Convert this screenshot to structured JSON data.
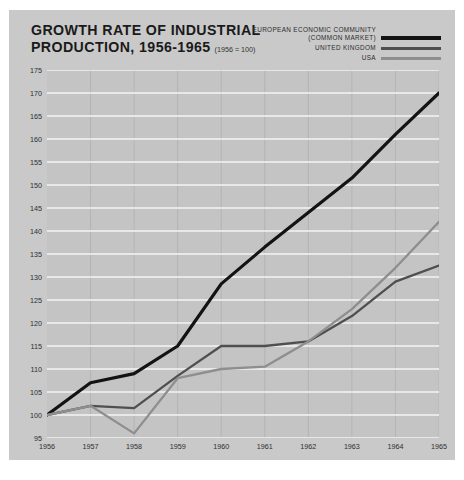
{
  "title": {
    "line1": "GROWTH RATE OF INDUSTRIAL",
    "line2": "PRODUCTION, 1956-1965",
    "base_note": "(1956 = 100)"
  },
  "legend": [
    {
      "name": "legend-eec",
      "label": "EUROPEAN ECONOMIC COMMUNITY",
      "sublabel": "(COMMON MARKET)",
      "color": "#131313"
    },
    {
      "name": "legend-uk",
      "label": "UNITED KINGDOM",
      "sublabel": "",
      "color": "#4f4f4f"
    },
    {
      "name": "legend-usa",
      "label": "USA",
      "sublabel": "",
      "color": "#8e8e8e"
    }
  ],
  "chart_data": {
    "type": "line",
    "xlabel": "",
    "ylabel": "",
    "x": [
      1956,
      1957,
      1958,
      1959,
      1960,
      1961,
      1962,
      1963,
      1964,
      1965
    ],
    "xticklabels": [
      "1956",
      "1957",
      "1958",
      "1959",
      "1960",
      "1961",
      "1962",
      "1963",
      "1964",
      "1965"
    ],
    "yticks": [
      95,
      100,
      105,
      110,
      115,
      120,
      125,
      130,
      135,
      140,
      145,
      150,
      155,
      160,
      165,
      170,
      175
    ],
    "yticklabels": [
      "95",
      "100",
      "105",
      "110",
      "115",
      "120",
      "125",
      "130",
      "135",
      "140",
      "145",
      "150",
      "155",
      "160",
      "165",
      "170",
      "175"
    ],
    "ylim": [
      95,
      175
    ],
    "xlim": [
      1956,
      1965
    ],
    "grid": "horizontal-white-and-faint-vertical",
    "legend_position": "top-right outside",
    "series": [
      {
        "name": "EUROPEAN ECONOMIC COMMUNITY (COMMON MARKET)",
        "color": "#131313",
        "width": 3.2,
        "values": [
          100,
          107,
          109,
          115,
          128.5,
          136.5,
          144,
          151.5,
          161,
          170
        ]
      },
      {
        "name": "UNITED KINGDOM",
        "color": "#4f4f4f",
        "width": 2.3,
        "values": [
          100,
          102,
          101.5,
          108.5,
          115,
          115,
          116,
          121.5,
          129,
          132.5
        ]
      },
      {
        "name": "USA",
        "color": "#8e8e8e",
        "width": 2.3,
        "values": [
          100,
          102,
          96,
          108,
          110,
          110.5,
          116,
          123,
          132,
          142
        ]
      }
    ]
  }
}
